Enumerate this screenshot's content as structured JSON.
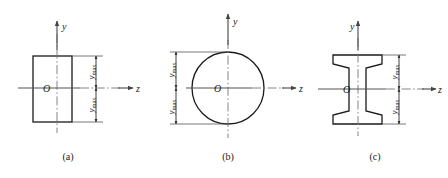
{
  "figure": {
    "panels": [
      {
        "id": "a",
        "caption": "(a)",
        "shape": "rectangle",
        "axis_y_label": "y",
        "axis_z_label": "z",
        "origin_label": "O",
        "dimension_upper_label": "ymax",
        "dimension_lower_label": "ymax",
        "dimension_side": "right",
        "geometry": {
          "left": 33,
          "right": 72,
          "top": 56,
          "bottom": 122,
          "center_x": 57,
          "center_y": 88,
          "dimension_line_x": 96,
          "y_axis_top": 21,
          "y_axis_bottom": 133,
          "z_axis_left": 18,
          "z_axis_right": 133,
          "y_label_x": 62,
          "y_label_y": 27,
          "z_label_x": 137,
          "z_label_y": 91
        }
      },
      {
        "id": "b",
        "caption": "(b)",
        "shape": "circle",
        "axis_y_label": "y",
        "axis_z_label": "z",
        "origin_label": "O",
        "dimension_upper_label": "ymax",
        "dimension_lower_label": "ymax",
        "dimension_side": "left",
        "geometry": {
          "center_x": 228,
          "center_y": 88,
          "radius": 36,
          "dimension_line_x": 176,
          "y_axis_top": 14,
          "y_axis_bottom": 138,
          "z_axis_left": 170,
          "z_axis_right": 296,
          "y_label_x": 234,
          "y_label_y": 22,
          "z_label_x": 299,
          "z_label_y": 91
        }
      },
      {
        "id": "c",
        "caption": "(c)",
        "shape": "i-beam",
        "axis_y_label": "y",
        "axis_z_label": "z",
        "origin_label": "O",
        "dimension_upper_label": "ymax",
        "dimension_lower_label": "ymax",
        "dimension_side": "right",
        "geometry": {
          "flange_left": 333,
          "flange_right": 382,
          "web_left": 352,
          "web_right": 364,
          "top": 55,
          "bottom": 124,
          "top_flange_bottom": 68,
          "bottom_flange_top": 111,
          "center_x": 358,
          "center_y": 89,
          "dimension_line_x": 399,
          "y_axis_top": 21,
          "y_axis_bottom": 136,
          "z_axis_left": 318,
          "z_axis_right": 436,
          "y_label_x": 353,
          "y_label_y": 27,
          "z_label_x": 439,
          "z_label_y": 92
        }
      }
    ],
    "colors": {
      "outline": "#1a1a1a",
      "axis": "#555555",
      "dimension": "#3a3a3a",
      "background": "#ffffff",
      "text": "#1a1a1a"
    }
  }
}
